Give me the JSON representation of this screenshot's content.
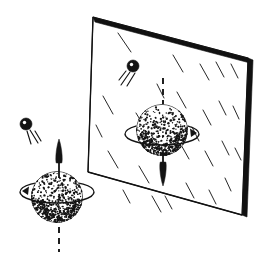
{
  "figure": {
    "caption": "",
    "type": "line-art-diagram",
    "background_color": "#ffffff",
    "ink_color": "#141414",
    "width": 260,
    "height": 256
  },
  "mirror": {
    "label": "mirror",
    "surface_fill": "#ffffff",
    "edge_color": "#111111",
    "frame_thickness": 4,
    "corners": {
      "top_left": [
        93,
        17
      ],
      "top_right": [
        248,
        58
      ],
      "bottom_right": [
        242,
        215
      ],
      "bottom_left": [
        88,
        172
      ]
    },
    "glint_marks": {
      "label": "glass-glint-hatching",
      "count": 26,
      "angle_degrees": 62,
      "length": 15,
      "strokes": [
        [
          118,
          33,
          131,
          52
        ],
        [
          103,
          96,
          113,
          114
        ],
        [
          108,
          151,
          118,
          168
        ],
        [
          136,
          113,
          147,
          131
        ],
        [
          139,
          166,
          149,
          183
        ],
        [
          152,
          196,
          161,
          212
        ],
        [
          173,
          55,
          183,
          72
        ],
        [
          177,
          92,
          186,
          108
        ],
        [
          180,
          143,
          189,
          159
        ],
        [
          186,
          183,
          194,
          198
        ],
        [
          200,
          64,
          209,
          80
        ],
        [
          203,
          110,
          211,
          125
        ],
        [
          205,
          151,
          213,
          166
        ],
        [
          209,
          190,
          216,
          204
        ],
        [
          216,
          62,
          224,
          77
        ],
        [
          219,
          101,
          226,
          115
        ],
        [
          222,
          141,
          229,
          155
        ],
        [
          225,
          178,
          231,
          191
        ],
        [
          231,
          64,
          238,
          78
        ],
        [
          233,
          106,
          239,
          119
        ],
        [
          235,
          148,
          241,
          160
        ],
        [
          165,
          196,
          172,
          209
        ],
        [
          123,
          190,
          130,
          203
        ],
        [
          96,
          125,
          102,
          137
        ],
        [
          192,
          127,
          199,
          141
        ],
        [
          157,
          84,
          164,
          98
        ]
      ]
    }
  },
  "objects": {
    "real": {
      "name": "real-spinning-sphere",
      "sphere": {
        "label": "stippled-sphere",
        "center": [
          57,
          197
        ],
        "radius": 26,
        "stipple_dots": 520
      },
      "spin_ring": {
        "label": "equatorial-spin-ring",
        "center": [
          57,
          192
        ],
        "rx": 37,
        "ry": 11,
        "arrow_side": "left",
        "direction": "counterclockwise-from-above"
      },
      "axis_arrow": {
        "label": "spin-axis-arrow",
        "direction": "up",
        "x": 59,
        "tail_y": 178,
        "tip_y": 139
      },
      "axis_dashed": {
        "label": "spin-axis-dashed-continuation",
        "x": 59,
        "from_y": 216,
        "to_y": 252,
        "dash": "6 5"
      },
      "particle": {
        "label": "incoming-particle",
        "center": [
          26,
          124
        ],
        "radius": 6,
        "highlight_offset": [
          -1.5,
          -1.5
        ],
        "trail_lines": [
          [
            30,
            130,
            38,
            143
          ],
          [
            35,
            131,
            41,
            141
          ],
          [
            27,
            131,
            31,
            144
          ]
        ]
      }
    },
    "reflected": {
      "name": "mirror-image-spinning-sphere",
      "sphere": {
        "label": "stippled-sphere",
        "center": [
          162,
          130
        ],
        "radius": 26,
        "stipple_dots": 520
      },
      "spin_ring": {
        "label": "equatorial-spin-ring",
        "center": [
          162,
          134
        ],
        "rx": 37,
        "ry": 11,
        "arrow_side": "right",
        "direction": "clockwise-from-above"
      },
      "axis_arrow": {
        "label": "spin-axis-arrow",
        "direction": "down",
        "x": 163,
        "tail_y": 150,
        "tip_y": 186
      },
      "axis_dashed": {
        "label": "spin-axis-dashed-continuation",
        "x": 163,
        "from_y": 78,
        "to_y": 110,
        "dash": "6 5"
      },
      "particle": {
        "label": "reflected-particle",
        "center": [
          133,
          66
        ],
        "radius": 6,
        "highlight_offset": [
          -1.5,
          -1.5
        ],
        "trail_lines": [
          [
            130,
            72,
            121,
            85
          ],
          [
            135,
            73,
            127,
            86
          ],
          [
            126,
            71,
            119,
            80
          ]
        ]
      }
    }
  }
}
